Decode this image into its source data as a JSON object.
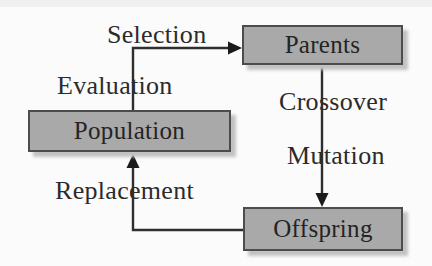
{
  "diagram": {
    "type": "flow-cycle",
    "nodes": [
      {
        "id": "population",
        "label": "Population"
      },
      {
        "id": "parents",
        "label": "Parents"
      },
      {
        "id": "offspring",
        "label": "Offspring"
      }
    ],
    "edge_labels": [
      {
        "id": "selection",
        "text": "Selection"
      },
      {
        "id": "evaluation",
        "text": "Evaluation"
      },
      {
        "id": "crossover",
        "text": "Crossover"
      },
      {
        "id": "mutation",
        "text": "Mutation"
      },
      {
        "id": "replacement",
        "text": "Replacement"
      }
    ],
    "arrows": [
      {
        "id": "population-to-parents",
        "from": "population",
        "to": "parents"
      },
      {
        "id": "parents-to-offspring",
        "from": "parents",
        "to": "offspring"
      },
      {
        "id": "offspring-to-population",
        "from": "offspring",
        "to": "population"
      }
    ],
    "colors": {
      "background": "#fbfbfb",
      "node_fill": "#a9a9a9",
      "node_border": "#4c4c4c",
      "node_shadow": "#c2c2c2",
      "arrow": "#2e2e2e",
      "text": "#2b2b2b"
    }
  }
}
